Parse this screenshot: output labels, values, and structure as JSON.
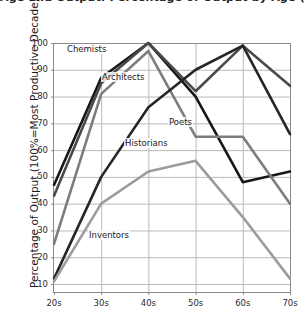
{
  "figure": {
    "clipped_title": "Age and Output: Percentage of Output by Age (Percent)",
    "background": "#ffffff"
  },
  "chart_data": {
    "type": "line",
    "title": "",
    "xlabel": "Decade",
    "ylabel": "Percentage of Output (100%=Most Productive Decade)",
    "categories": [
      "20s",
      "30s",
      "40s",
      "50s",
      "60s",
      "70s"
    ],
    "xtick_labels": [
      "20s",
      "30s",
      "40s",
      "50s",
      "60s",
      "70s"
    ],
    "ytick_labels": [
      "10",
      "20",
      "30",
      "40",
      "50",
      "60",
      "70",
      "80",
      "90",
      "100"
    ],
    "ylim": [
      0,
      100
    ],
    "grid": true,
    "legend_position": "inline-annotations",
    "series": [
      {
        "name": "Chemists",
        "color": "#171717",
        "values": [
          47,
          87,
          100,
          80,
          48,
          52
        ],
        "label_x": 66,
        "label_y": 44
      },
      {
        "name": "Architects",
        "color": "#4a4a4a",
        "values": [
          43,
          85,
          100,
          82,
          99,
          84
        ],
        "label_x": 101,
        "label_y": 72
      },
      {
        "name": "Poets",
        "color": "#7d7d7d",
        "values": [
          25,
          81,
          97,
          65,
          65,
          40
        ],
        "label_x": 168,
        "label_y": 117
      },
      {
        "name": "Historians",
        "color": "#262626",
        "values": [
          12,
          50,
          76,
          90,
          99,
          66
        ],
        "label_x": 124,
        "label_y": 138
      },
      {
        "name": "Inventors",
        "color": "#9c9c9c",
        "values": [
          11,
          40,
          52,
          56,
          35,
          12
        ],
        "label_x": 88,
        "label_y": 230
      }
    ]
  }
}
